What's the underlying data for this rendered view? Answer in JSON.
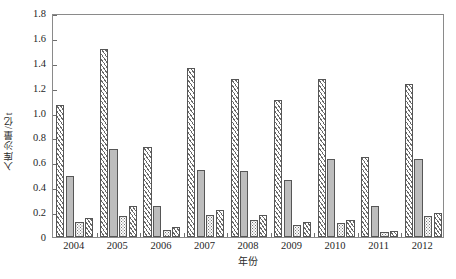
{
  "chart_data": {
    "type": "bar",
    "title": "",
    "xlabel": "年份",
    "ylabel": "入库沙量/亿t",
    "categories": [
      "2004",
      "2005",
      "2006",
      "2007",
      "2008",
      "2009",
      "2010",
      "2011",
      "2012"
    ],
    "ylim": [
      0,
      1.8
    ],
    "ytick_labels": [
      "0",
      "0.2",
      "0.4",
      "0.6",
      "0.8",
      "1.0",
      "1.2",
      "1.4",
      "1.6",
      "1.8"
    ],
    "ytick_values": [
      0,
      0.2,
      0.4,
      0.6,
      0.8,
      1.0,
      1.2,
      1.4,
      1.6,
      1.8
    ],
    "grid": false,
    "legend": "none",
    "series": [
      {
        "name": "series-1",
        "pattern": "diagonal-hatch",
        "values": [
          1.06,
          1.51,
          0.72,
          1.36,
          1.27,
          1.1,
          1.27,
          0.64,
          1.23
        ]
      },
      {
        "name": "series-2",
        "pattern": "solid-grey",
        "values": [
          0.49,
          0.71,
          0.25,
          0.54,
          0.53,
          0.46,
          0.63,
          0.25,
          0.63
        ]
      },
      {
        "name": "series-3",
        "pattern": "dotted",
        "values": [
          0.12,
          0.17,
          0.06,
          0.18,
          0.14,
          0.1,
          0.11,
          0.04,
          0.17
        ]
      },
      {
        "name": "series-4",
        "pattern": "diagonal-hatch",
        "values": [
          0.15,
          0.25,
          0.08,
          0.22,
          0.18,
          0.12,
          0.14,
          0.05,
          0.19
        ]
      }
    ]
  }
}
